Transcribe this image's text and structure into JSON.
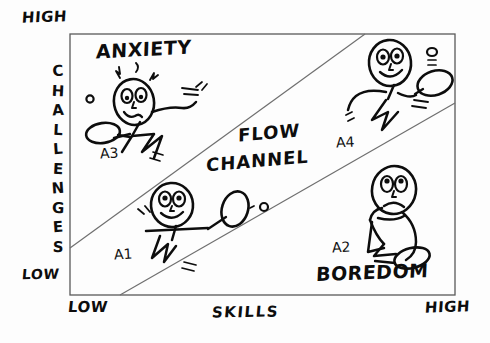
{
  "diagram": {
    "axes": {
      "y_label": "CHALLENGES",
      "y_high": "HIGH",
      "y_low": "LOW",
      "x_label": "SKILLS",
      "x_low": "LOW",
      "x_high": "HIGH"
    },
    "regions": [
      {
        "name": "anxiety",
        "label": "ANXIETY"
      },
      {
        "name": "flow-channel",
        "label_line1": "FLOW",
        "label_line2": "CHANNEL"
      },
      {
        "name": "boredom",
        "label": "BOREDOM"
      }
    ],
    "figures": [
      {
        "id": "A3",
        "region": "anxiety",
        "mood": "stressed",
        "prop": "racket"
      },
      {
        "id": "A1",
        "region": "flow-channel",
        "mood": "happy",
        "prop": "racket"
      },
      {
        "id": "A4",
        "region": "flow-channel",
        "mood": "happy",
        "prop": "racket"
      },
      {
        "id": "A2",
        "region": "boredom",
        "mood": "bored",
        "prop": "racket"
      }
    ],
    "colors": {
      "ink": "#0d0d0d",
      "frame": "#555555",
      "channel_line": "#6b6b6b",
      "background": "#fdfdfd"
    }
  }
}
